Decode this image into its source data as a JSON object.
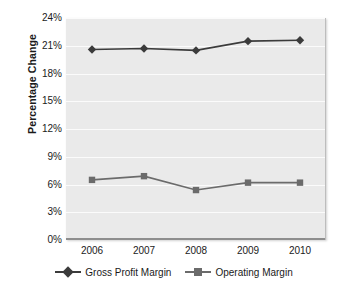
{
  "chart_data": {
    "type": "line",
    "title": "",
    "xlabel": "",
    "ylabel": "Percentage Change",
    "categories": [
      "2006",
      "2007",
      "2008",
      "2009",
      "2010"
    ],
    "ylim": [
      0,
      24
    ],
    "ytick_labels": [
      "0%",
      "3%",
      "6%",
      "9%",
      "12%",
      "15%",
      "18%",
      "21%",
      "24%"
    ],
    "ytick_values": [
      0,
      3,
      6,
      9,
      12,
      15,
      18,
      21,
      24
    ],
    "grid": true,
    "legend_position": "bottom",
    "series": [
      {
        "name": "Gross Profit Margin",
        "marker": "diamond",
        "color": "#3b3b3b",
        "values": [
          20.6,
          20.7,
          20.5,
          21.5,
          21.6
        ]
      },
      {
        "name": "Operating Margin",
        "marker": "square",
        "color": "#6b6b6b",
        "values": [
          6.5,
          6.9,
          5.4,
          6.2,
          6.2
        ]
      }
    ]
  },
  "colors": {
    "plot_background": "#eaeaea",
    "gridline": "#fbfbfb",
    "axis": "#8e8e8e",
    "page_background": "#ffffff",
    "text": "#1a1a1a"
  }
}
